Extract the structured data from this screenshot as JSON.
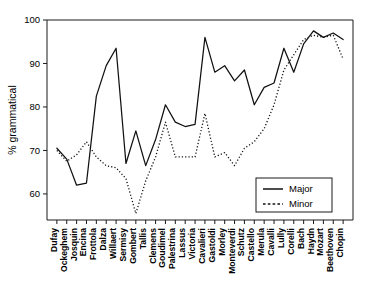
{
  "chart_data": {
    "type": "line",
    "title": "",
    "xlabel": "",
    "ylabel": "% grammatical",
    "ylim": [
      54,
      100
    ],
    "yticks": [
      60,
      70,
      80,
      90,
      100
    ],
    "ytick_labels": [
      "60",
      "70",
      "80",
      "90",
      "100"
    ],
    "grid": false,
    "legend_position": "lower right",
    "categories": [
      "Dufay",
      "Ockeghem",
      "Josquin",
      "Encina",
      "Frottola",
      "Dalza",
      "Willaert",
      "Sermisy",
      "Gombert",
      "Tallis",
      "Clemens",
      "Goudimel",
      "Palestrina",
      "Lassus",
      "Victoria",
      "Cavalieri",
      "Gastoldi",
      "Morley",
      "Monteverdi",
      "Schutz",
      "Castello",
      "Merula",
      "Cavalli",
      "Lully",
      "Corelli",
      "Bach",
      "Haydn",
      "Mozart",
      "Beethoven",
      "Chopin"
    ],
    "series": [
      {
        "name": "Major",
        "style": "solid",
        "values": [
          70.5,
          68.0,
          62.0,
          62.5,
          82.5,
          89.5,
          93.5,
          67.0,
          74.5,
          66.5,
          72.5,
          80.5,
          76.5,
          75.5,
          76.0,
          96.0,
          88.0,
          89.5,
          86.0,
          88.5,
          80.5,
          84.5,
          85.5,
          93.5,
          88.0,
          94.5,
          97.5,
          96.0,
          97.0,
          95.5
        ]
      },
      {
        "name": "Minor",
        "style": "dashed",
        "values": [
          70.0,
          67.5,
          69.0,
          72.0,
          68.5,
          66.5,
          66.0,
          63.5,
          55.5,
          63.0,
          68.5,
          76.5,
          68.5,
          68.5,
          68.5,
          78.5,
          68.5,
          69.5,
          66.5,
          70.5,
          72.0,
          75.0,
          80.5,
          88.5,
          92.0,
          95.5,
          96.5,
          96.0,
          96.5,
          91.0
        ]
      }
    ],
    "legend": [
      {
        "label": "Major",
        "style": "solid"
      },
      {
        "label": "Minor",
        "style": "dashed"
      }
    ]
  }
}
